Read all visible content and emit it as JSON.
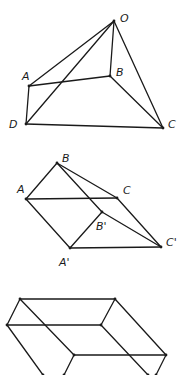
{
  "figures": [
    {
      "name": "pyramid",
      "vertices": {
        "O": {
          "x": 114,
          "y": 21,
          "label": "O",
          "lx": 120,
          "ly": 22
        },
        "A": {
          "x": 29,
          "y": 86,
          "label": "A",
          "lx": 22,
          "ly": 80
        },
        "B": {
          "x": 110,
          "y": 76,
          "label": "B",
          "lx": 116,
          "ly": 76
        },
        "D": {
          "x": 26,
          "y": 124,
          "label": "D",
          "lx": 9,
          "ly": 128
        },
        "C": {
          "x": 163,
          "y": 128,
          "label": "C",
          "lx": 168,
          "ly": 128
        }
      },
      "edges": [
        [
          "O",
          "A"
        ],
        [
          "O",
          "D"
        ],
        [
          "O",
          "B"
        ],
        [
          "O",
          "C"
        ],
        [
          "A",
          "B"
        ],
        [
          "A",
          "D"
        ],
        [
          "D",
          "C"
        ],
        [
          "B",
          "C"
        ]
      ]
    },
    {
      "name": "prism",
      "vertices": {
        "B": {
          "x": 57,
          "y": 163,
          "label": "B",
          "lx": 62,
          "ly": 162
        },
        "A": {
          "x": 26,
          "y": 199,
          "label": "A",
          "lx": 17,
          "ly": 193
        },
        "C": {
          "x": 117,
          "y": 198,
          "label": "C",
          "lx": 123,
          "ly": 194
        },
        "B'": {
          "x": 102,
          "y": 212,
          "label": "B'",
          "lx": 96,
          "ly": 230
        },
        "A'": {
          "x": 70,
          "y": 248,
          "label": "A'",
          "lx": 59,
          "ly": 266
        },
        "C'": {
          "x": 161,
          "y": 247,
          "label": "C'",
          "lx": 166,
          "ly": 246
        }
      },
      "edges": [
        [
          "B",
          "A"
        ],
        [
          "B",
          "C"
        ],
        [
          "B",
          "B'"
        ],
        [
          "A",
          "C"
        ],
        [
          "A",
          "A'"
        ],
        [
          "C",
          "C'"
        ],
        [
          "A'",
          "B'"
        ],
        [
          "A'",
          "C'"
        ],
        [
          "B'",
          "C'"
        ]
      ]
    },
    {
      "name": "box",
      "vertices": {
        "P1": {
          "x": 20,
          "y": 299
        },
        "P2": {
          "x": 115,
          "y": 299
        },
        "P3": {
          "x": 7,
          "y": 325
        },
        "P4": {
          "x": 101,
          "y": 325
        },
        "P5": {
          "x": 74,
          "y": 355
        },
        "P6": {
          "x": 166,
          "y": 355
        },
        "P7": {
          "x": 64,
          "y": 375
        },
        "P8": {
          "x": 156,
          "y": 375
        },
        "P9": {
          "x": 43,
          "y": 375
        },
        "P10": {
          "x": 148,
          "y": 375
        }
      },
      "edges": [
        [
          "P1",
          "P2"
        ],
        [
          "P1",
          "P3"
        ],
        [
          "P2",
          "P4"
        ],
        [
          "P3",
          "P4"
        ],
        [
          "P1",
          "P5"
        ],
        [
          "P2",
          "P6"
        ],
        [
          "P5",
          "P6"
        ],
        [
          "P3",
          "P9"
        ],
        [
          "P4",
          "P10"
        ],
        [
          "P5",
          "P7"
        ],
        [
          "P6",
          "P8"
        ]
      ]
    }
  ]
}
